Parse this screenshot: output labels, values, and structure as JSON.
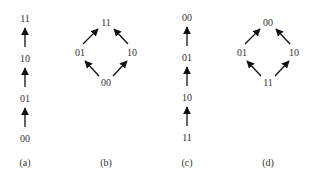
{
  "figure": {
    "panels": [
      {
        "caption": "(a)",
        "type": "chain",
        "nodes": [
          {
            "id": "11",
            "label": "11",
            "x": 25,
            "y": 18
          },
          {
            "id": "10",
            "label": "10",
            "x": 25,
            "y": 58
          },
          {
            "id": "01",
            "label": "01",
            "x": 25,
            "y": 98
          },
          {
            "id": "00",
            "label": "00",
            "x": 25,
            "y": 138
          }
        ],
        "edges": [
          {
            "from": "00",
            "to": "01"
          },
          {
            "from": "01",
            "to": "10"
          },
          {
            "from": "10",
            "to": "11"
          }
        ]
      },
      {
        "caption": "(b)",
        "type": "diamond",
        "nodes": [
          {
            "id": "11",
            "label": "11",
            "x": 106,
            "y": 23
          },
          {
            "id": "01",
            "label": "01",
            "x": 80,
            "y": 53
          },
          {
            "id": "10",
            "label": "10",
            "x": 131,
            "y": 53
          },
          {
            "id": "00",
            "label": "00",
            "x": 106,
            "y": 83
          }
        ],
        "edges": [
          {
            "from": "00",
            "to": "01"
          },
          {
            "from": "00",
            "to": "10"
          },
          {
            "from": "01",
            "to": "11"
          },
          {
            "from": "10",
            "to": "11"
          }
        ]
      },
      {
        "caption": "(c)",
        "type": "chain",
        "nodes": [
          {
            "id": "00",
            "label": "00",
            "x": 187,
            "y": 18
          },
          {
            "id": "01",
            "label": "01",
            "x": 187,
            "y": 58
          },
          {
            "id": "10",
            "label": "10",
            "x": 187,
            "y": 98
          },
          {
            "id": "11",
            "label": "11",
            "x": 187,
            "y": 138
          }
        ],
        "edges": [
          {
            "from": "11",
            "to": "10"
          },
          {
            "from": "10",
            "to": "01"
          },
          {
            "from": "01",
            "to": "00"
          }
        ]
      },
      {
        "caption": "(d)",
        "type": "diamond",
        "nodes": [
          {
            "id": "00",
            "label": "00",
            "x": 268,
            "y": 23
          },
          {
            "id": "01",
            "label": "01",
            "x": 241,
            "y": 53
          },
          {
            "id": "10",
            "label": "10",
            "x": 294,
            "y": 53
          },
          {
            "id": "11",
            "label": "11",
            "x": 268,
            "y": 83
          }
        ],
        "edges": [
          {
            "from": "11",
            "to": "01"
          },
          {
            "from": "11",
            "to": "10"
          },
          {
            "from": "01",
            "to": "00"
          },
          {
            "from": "10",
            "to": "00"
          }
        ]
      }
    ]
  }
}
